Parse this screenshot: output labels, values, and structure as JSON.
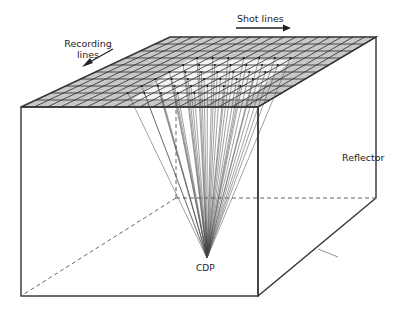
{
  "diagram": {
    "labels": {
      "recording_lines_line1": "Recording",
      "recording_lines_line2": "lines",
      "shot_lines": "Shot lines",
      "cdp": "CDP",
      "reflector": "Reflector",
      "page_edge_fragment": "|"
    },
    "arrows": {
      "recording_lines": {
        "direction": "down-left"
      },
      "shot_lines": {
        "direction": "right"
      }
    },
    "box": {
      "top_face": {
        "fill": "#c8c8c8",
        "grid": "shot lines x recording lines"
      },
      "front_face": {
        "fill": "#ffffff"
      },
      "side_face": {
        "fill": "#ffffff"
      },
      "hidden_edges": "dashed"
    },
    "rays": {
      "count": 40,
      "converge_to": "CDP",
      "color": "#333333"
    },
    "colors": {
      "outline": "#333333",
      "grid_fill": "#c8c8c8",
      "grid_lines": "#2a2a2a",
      "background": "#ffffff"
    }
  }
}
